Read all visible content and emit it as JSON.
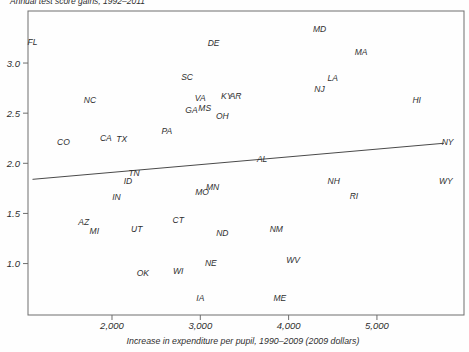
{
  "figure": {
    "title": "Annual test score gains, 1992–2011",
    "title_note": "clipped at top edge of image",
    "xlabel": "Increase in expenditure per pupil, 1990–2009 (2009 dollars)",
    "ink_color": "#2f2f2f",
    "axis_color": "#6e6e6e",
    "trendline_color": "#4a4a4a",
    "background_color": "#fefefe"
  },
  "chart_data": {
    "type": "scatter",
    "title": "Annual test score gains, 1992–2011",
    "xlabel": "Increase in expenditure per pupil, 1990–2009 (2009 dollars)",
    "ylabel": "Annual test score gains, 1992–2011",
    "marker": "state-abbreviation-text",
    "grid": false,
    "legend": "none",
    "xlim": [
      1049,
      5986
    ],
    "ylim": [
      0.487,
      3.519
    ],
    "x_ticks": [
      {
        "value": 2000,
        "label": "2,000"
      },
      {
        "value": 3000,
        "label": "3,000"
      },
      {
        "value": 4000,
        "label": "4,000"
      },
      {
        "value": 5000,
        "label": "5,000"
      }
    ],
    "y_ticks": [
      {
        "value": 1.0,
        "label": "1.0"
      },
      {
        "value": 1.5,
        "label": "1.5"
      },
      {
        "value": 2.0,
        "label": "2.0"
      },
      {
        "value": 2.5,
        "label": "2.5"
      },
      {
        "value": 3.0,
        "label": "3.0"
      }
    ],
    "points": [
      {
        "label": "FL",
        "x": 1100,
        "y": 3.21
      },
      {
        "label": "DE",
        "x": 3150,
        "y": 3.2
      },
      {
        "label": "MD",
        "x": 4350,
        "y": 3.34
      },
      {
        "label": "MA",
        "x": 4820,
        "y": 3.11
      },
      {
        "label": "SC",
        "x": 2850,
        "y": 2.86
      },
      {
        "label": "NC",
        "x": 1750,
        "y": 2.63
      },
      {
        "label": "VA",
        "x": 3000,
        "y": 2.65
      },
      {
        "label": "KY",
        "x": 3300,
        "y": 2.67
      },
      {
        "label": "AR",
        "x": 3400,
        "y": 2.67
      },
      {
        "label": "GA",
        "x": 2900,
        "y": 2.53
      },
      {
        "label": "MS",
        "x": 3050,
        "y": 2.55
      },
      {
        "label": "OH",
        "x": 3250,
        "y": 2.47
      },
      {
        "label": "LA",
        "x": 4500,
        "y": 2.85
      },
      {
        "label": "NJ",
        "x": 4350,
        "y": 2.74
      },
      {
        "label": "HI",
        "x": 5450,
        "y": 2.63
      },
      {
        "label": "CO",
        "x": 1450,
        "y": 2.21
      },
      {
        "label": "CA",
        "x": 1930,
        "y": 2.25
      },
      {
        "label": "TX",
        "x": 2110,
        "y": 2.24
      },
      {
        "label": "PA",
        "x": 2620,
        "y": 2.32
      },
      {
        "label": "AL",
        "x": 3700,
        "y": 2.04
      },
      {
        "label": "NY",
        "x": 5800,
        "y": 2.21
      },
      {
        "label": "TN",
        "x": 2250,
        "y": 1.9
      },
      {
        "label": "ID",
        "x": 2180,
        "y": 1.82
      },
      {
        "label": "IN",
        "x": 2050,
        "y": 1.66
      },
      {
        "label": "MO",
        "x": 3020,
        "y": 1.71
      },
      {
        "label": "MN",
        "x": 3140,
        "y": 1.76
      },
      {
        "label": "NH",
        "x": 4510,
        "y": 1.82
      },
      {
        "label": "RI",
        "x": 4740,
        "y": 1.67
      },
      {
        "label": "WY",
        "x": 5780,
        "y": 1.82
      },
      {
        "label": "AZ",
        "x": 1680,
        "y": 1.41
      },
      {
        "label": "MI",
        "x": 1800,
        "y": 1.32
      },
      {
        "label": "UT",
        "x": 2280,
        "y": 1.34
      },
      {
        "label": "CT",
        "x": 2750,
        "y": 1.43
      },
      {
        "label": "ND",
        "x": 3250,
        "y": 1.3
      },
      {
        "label": "OK",
        "x": 2350,
        "y": 0.91
      },
      {
        "label": "WI",
        "x": 2750,
        "y": 0.93
      },
      {
        "label": "NE",
        "x": 3120,
        "y": 1.01
      },
      {
        "label": "IA",
        "x": 3000,
        "y": 0.66
      },
      {
        "label": "NM",
        "x": 3860,
        "y": 1.34
      },
      {
        "label": "WV",
        "x": 4050,
        "y": 1.04
      },
      {
        "label": "ME",
        "x": 3900,
        "y": 0.66
      }
    ],
    "trendline": {
      "x1": 1100,
      "y1": 1.84,
      "x2": 5760,
      "y2": 2.2
    }
  }
}
